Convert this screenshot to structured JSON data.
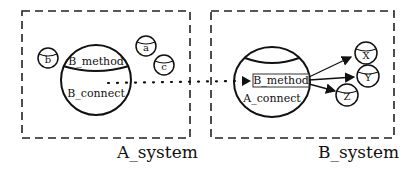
{
  "diagram": {
    "systems": [
      {
        "name": "A_system",
        "component": {
          "top_label": "B_method",
          "bottom_label": "B_connect"
        },
        "objects": [
          "b",
          "a",
          "c"
        ]
      },
      {
        "name": "B_system",
        "component": {
          "method_box_label": "B_method",
          "bottom_label": "A_connect"
        },
        "objects": [
          "X",
          "Y",
          "Z"
        ]
      }
    ],
    "connections": [
      {
        "from": "A_system.B_connect",
        "to": "B_system.B_method",
        "style": "dotted-arrow"
      },
      {
        "from": "B_system.B_method",
        "to": "X",
        "style": "arrow"
      },
      {
        "from": "B_system.B_method",
        "to": "Y",
        "style": "arrow"
      },
      {
        "from": "B_system.B_method",
        "to": "Z",
        "style": "arrow"
      }
    ]
  }
}
